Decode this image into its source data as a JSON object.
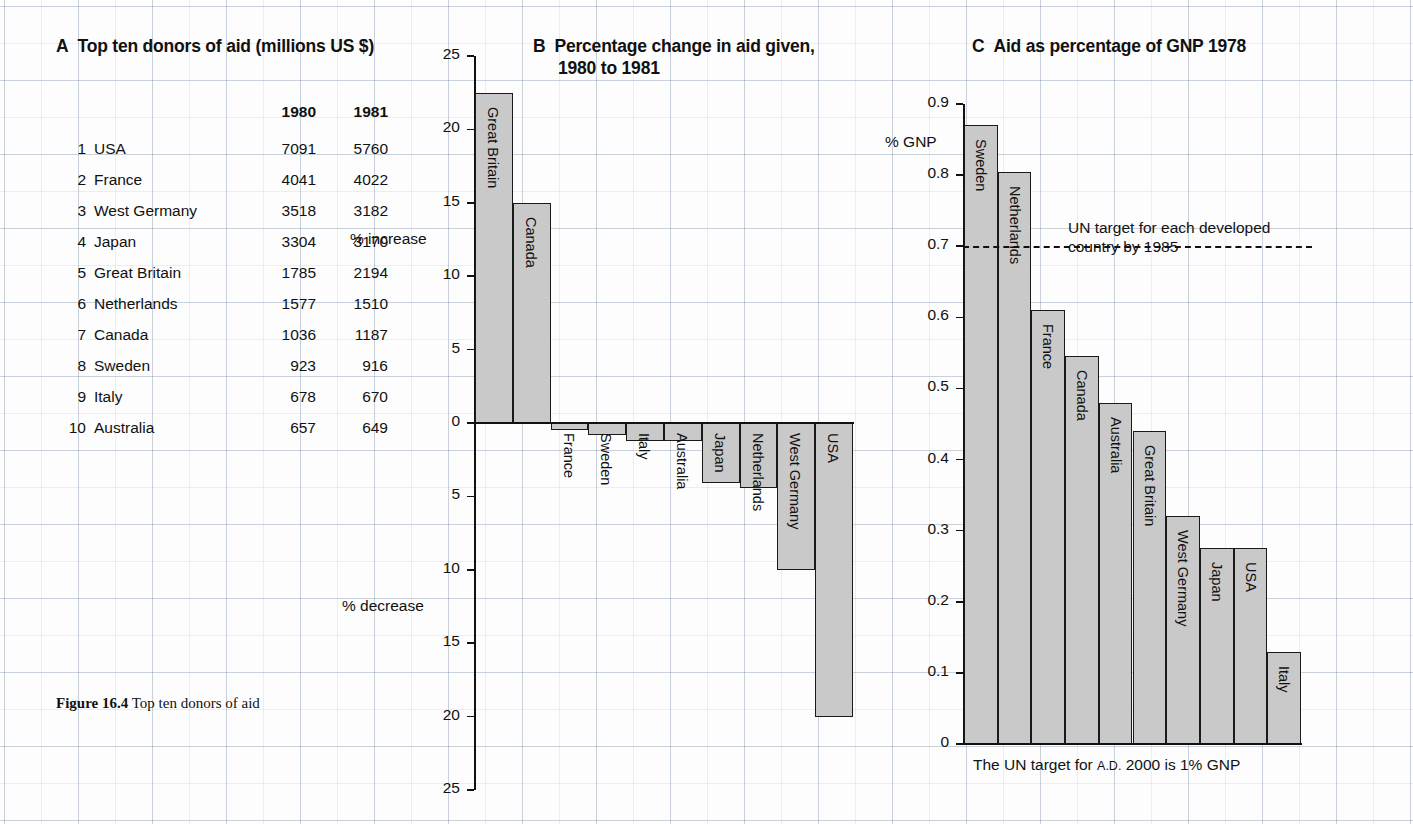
{
  "figure": {
    "caption_label": "Figure 16.4",
    "caption_text": "Top ten donors of aid"
  },
  "panelA": {
    "letter": "A",
    "title": "Top ten donors of aid (millions US $)",
    "columns": [
      "",
      "",
      "1980",
      "1981"
    ],
    "rows": [
      {
        "rank": "1",
        "country": "USA",
        "y1980": "7091",
        "y1981": "5760"
      },
      {
        "rank": "2",
        "country": "France",
        "y1980": "4041",
        "y1981": "4022"
      },
      {
        "rank": "3",
        "country": "West Germany",
        "y1980": "3518",
        "y1981": "3182"
      },
      {
        "rank": "4",
        "country": "Japan",
        "y1980": "3304",
        "y1981": "3170"
      },
      {
        "rank": "5",
        "country": "Great Britain",
        "y1980": "1785",
        "y1981": "2194"
      },
      {
        "rank": "6",
        "country": "Netherlands",
        "y1980": "1577",
        "y1981": "1510"
      },
      {
        "rank": "7",
        "country": "Canada",
        "y1980": "1036",
        "y1981": "1187"
      },
      {
        "rank": "8",
        "country": "Sweden",
        "y1980": "923",
        "y1981": "916"
      },
      {
        "rank": "9",
        "country": "Italy",
        "y1980": "678",
        "y1981": "670"
      },
      {
        "rank": "10",
        "country": "Australia",
        "y1980": "657",
        "y1981": "649"
      }
    ]
  },
  "panelB": {
    "letter": "B",
    "title_line1": "Percentage change in aid given,",
    "title_line2": "1980 to 1981",
    "increase_label": "% increase",
    "decrease_label": "% decrease",
    "tick_labels": [
      "25",
      "20",
      "15",
      "10",
      "5",
      "0",
      "5",
      "10",
      "15",
      "20",
      "25"
    ]
  },
  "panelC": {
    "letter": "C",
    "title": "Aid as percentage of GNP 1978",
    "axis_label": "% GNP",
    "tick_labels": [
      "0.9",
      "0.8",
      "0.7",
      "0.6",
      "0.5",
      "0.4",
      "0.3",
      "0.2",
      "0.1",
      "0"
    ],
    "un_target_line1": "UN target for each developed",
    "un_target_line2": "country by 1985",
    "footnote_pre": "The UN target for ",
    "footnote_sc": "A.D.",
    "footnote_post": " 2000 is 1% GNP"
  },
  "colors": {
    "bar_fill": "#c9c9c9",
    "bar_stroke": "#1a1a1a",
    "grid": "#8fa0b5",
    "ink": "#111111"
  },
  "chart_data": [
    {
      "type": "bar",
      "title": "B  Percentage change in aid given, 1980 to 1981",
      "xlabel": "",
      "ylabel": "% change",
      "ylim": [
        -25,
        25
      ],
      "grid": true,
      "orientation": "vertical",
      "categories": [
        "Great Britain",
        "Canada",
        "France",
        "Sweden",
        "Italy",
        "Australia",
        "Japan",
        "Netherlands",
        "West Germany",
        "USA"
      ],
      "values": [
        22.5,
        15.0,
        -0.5,
        -0.8,
        -1.2,
        -1.2,
        -4.1,
        -4.4,
        -10.0,
        -20.0
      ],
      "annotations": [
        "% increase",
        "% decrease"
      ]
    },
    {
      "type": "bar",
      "title": "C  Aid as percentage of GNP 1978",
      "xlabel": "",
      "ylabel": "% GNP",
      "ylim": [
        0,
        0.9
      ],
      "grid": true,
      "orientation": "vertical",
      "categories": [
        "Sweden",
        "Netherlands",
        "France",
        "Canada",
        "Australia",
        "Great Britain",
        "West Germany",
        "Japan",
        "USA",
        "Italy"
      ],
      "values": [
        0.87,
        0.805,
        0.61,
        0.545,
        0.48,
        0.44,
        0.32,
        0.275,
        0.275,
        0.13
      ],
      "reference_line": {
        "value": 0.7,
        "style": "dashed",
        "label": "UN target for each developed country by 1985"
      },
      "annotations": [
        "The UN target for A.D. 2000 is 1% GNP"
      ]
    },
    {
      "type": "table",
      "title": "A  Top ten donors of aid (millions US $)",
      "columns": [
        "Rank",
        "Country",
        "1980",
        "1981"
      ],
      "rows": [
        [
          "1",
          "USA",
          7091,
          5760
        ],
        [
          "2",
          "France",
          4041,
          4022
        ],
        [
          "3",
          "West Germany",
          3518,
          3182
        ],
        [
          "4",
          "Japan",
          3304,
          3170
        ],
        [
          "5",
          "Great Britain",
          1785,
          2194
        ],
        [
          "6",
          "Netherlands",
          1577,
          1510
        ],
        [
          "7",
          "Canada",
          1036,
          1187
        ],
        [
          "8",
          "Sweden",
          923,
          916
        ],
        [
          "9",
          "Italy",
          678,
          670
        ],
        [
          "10",
          "Australia",
          657,
          649
        ]
      ]
    }
  ]
}
